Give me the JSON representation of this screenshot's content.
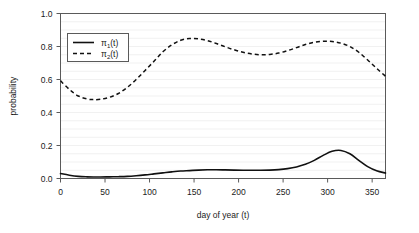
{
  "chart_data": {
    "type": "line",
    "title": "",
    "xlabel": "day of year (t)",
    "ylabel": "probability",
    "xlim": [
      0,
      365
    ],
    "ylim": [
      0.0,
      1.0
    ],
    "xticks": [
      0,
      50,
      100,
      150,
      200,
      250,
      300,
      350
    ],
    "xtick_labels": [
      "0",
      "50",
      "100",
      "150",
      "200",
      "250",
      "300",
      "350"
    ],
    "yticks": [
      0.0,
      0.2,
      0.4,
      0.6,
      0.8,
      1.0
    ],
    "ytick_labels": [
      "0.0",
      "0.2",
      "0.4",
      "0.6",
      "0.8",
      "1.0"
    ],
    "grid": "horizontal-minor-0.05",
    "gridlines_y": [
      0.05,
      0.1,
      0.15,
      0.2,
      0.25,
      0.3,
      0.35,
      0.4,
      0.45,
      0.5,
      0.55,
      0.6,
      0.65,
      0.7,
      0.75,
      0.8,
      0.85,
      0.9,
      0.95
    ],
    "legend_position": "top-left-inside",
    "legend_entries": [
      {
        "label": "π₁(t)",
        "base": "π",
        "sub": "1",
        "suffix": "(t)",
        "style": "solid"
      },
      {
        "label": "π₂(t)",
        "base": "π",
        "sub": "2",
        "suffix": "(t)",
        "style": "dashed"
      }
    ],
    "x": [
      0,
      10,
      20,
      30,
      37,
      45,
      55,
      65,
      75,
      85,
      95,
      105,
      115,
      125,
      135,
      145,
      155,
      165,
      175,
      185,
      195,
      205,
      215,
      225,
      235,
      245,
      255,
      265,
      275,
      285,
      295,
      305,
      315,
      325,
      335,
      345,
      355,
      365
    ],
    "series": [
      {
        "name": "π₁(t)",
        "style": "solid",
        "values": [
          0.03,
          0.02,
          0.013,
          0.01,
          0.009,
          0.009,
          0.01,
          0.011,
          0.013,
          0.017,
          0.022,
          0.028,
          0.034,
          0.04,
          0.045,
          0.048,
          0.051,
          0.053,
          0.053,
          0.052,
          0.051,
          0.05,
          0.05,
          0.05,
          0.051,
          0.054,
          0.06,
          0.07,
          0.086,
          0.11,
          0.14,
          0.165,
          0.17,
          0.15,
          0.11,
          0.072,
          0.047,
          0.033
        ]
      },
      {
        "name": "π₂(t)",
        "style": "dashed",
        "values": [
          0.592,
          0.54,
          0.5,
          0.482,
          0.478,
          0.48,
          0.492,
          0.515,
          0.552,
          0.6,
          0.655,
          0.71,
          0.768,
          0.81,
          0.838,
          0.848,
          0.846,
          0.836,
          0.818,
          0.798,
          0.78,
          0.765,
          0.755,
          0.75,
          0.752,
          0.76,
          0.775,
          0.793,
          0.812,
          0.826,
          0.832,
          0.83,
          0.82,
          0.8,
          0.765,
          0.718,
          0.668,
          0.62
        ]
      }
    ]
  },
  "axes": {
    "ylabel": "probability",
    "xlabel": "day of year (t)"
  }
}
